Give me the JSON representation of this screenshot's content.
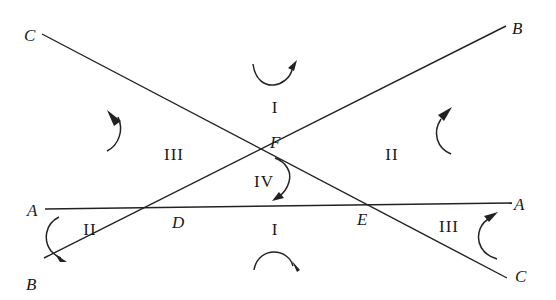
{
  "diagram": {
    "type": "three intersecting lines forming triangle DEF with regions",
    "lines": [
      {
        "name": "A-A",
        "from": [
          45,
          209
        ],
        "to": [
          512,
          203
        ],
        "labels": [
          "A",
          "A"
        ]
      },
      {
        "name": "B-B",
        "from": [
          44,
          258
        ],
        "to": [
          506,
          26
        ],
        "labels": [
          "B",
          "B"
        ]
      },
      {
        "name": "C-C",
        "from": [
          42,
          34
        ],
        "to": [
          507,
          278
        ],
        "labels": [
          "C",
          "C"
        ]
      }
    ],
    "points": {
      "A_left": {
        "label": "A",
        "x": 27,
        "y": 216
      },
      "A_right": {
        "label": "A",
        "x": 514,
        "y": 210
      },
      "B_left": {
        "label": "B",
        "x": 26,
        "y": 290
      },
      "B_right": {
        "label": "B",
        "x": 512,
        "y": 34
      },
      "C_left": {
        "label": "C",
        "x": 24,
        "y": 41
      },
      "C_right": {
        "label": "C",
        "x": 515,
        "y": 282
      },
      "D": {
        "label": "D",
        "x": 172,
        "y": 228
      },
      "E": {
        "label": "E",
        "x": 357,
        "y": 225
      },
      "F": {
        "label": "F",
        "x": 270,
        "y": 148
      }
    },
    "regions": [
      {
        "label": "I",
        "x": 275,
        "y": 113,
        "arrow": "cw-top"
      },
      {
        "label": "II",
        "x": 392,
        "y": 160,
        "arrow": "ccw-right"
      },
      {
        "label": "III",
        "x": 160,
        "y": 160,
        "arrow": "cw-left"
      },
      {
        "label": "IV",
        "x": 254,
        "y": 187,
        "arrow": "cw-inner"
      },
      {
        "label": "I",
        "x": 273,
        "y": 235,
        "arrow": "cw-bottom"
      },
      {
        "label": "II",
        "x": 80,
        "y": 235,
        "arrow": "ccw-bottom-left"
      },
      {
        "label": "III",
        "x": 432,
        "y": 232,
        "arrow": "ccw-bottom-right"
      }
    ]
  }
}
